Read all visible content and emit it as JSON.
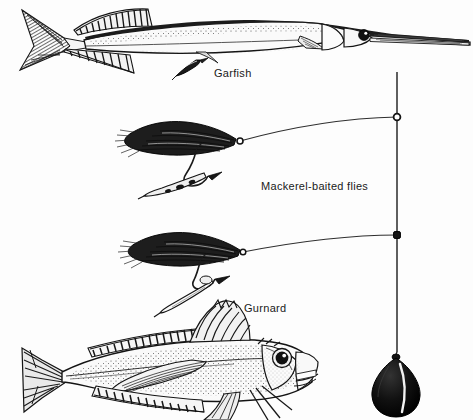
{
  "figure": {
    "kind": "line-illustration",
    "background_color": "#fdfdfd",
    "ink_color": "#1a1a1a",
    "width": 473,
    "height": 420
  },
  "labels": {
    "garfish": "Garfish",
    "mackerel_flies": "Mackerel-baited flies",
    "gurnard": "Gurnard"
  },
  "rig": {
    "mainline": {
      "name": "vertical-mainline",
      "x": 397,
      "y_top": 72,
      "y_bottom": 352,
      "color": "#2a2a2a"
    },
    "swivels": [
      {
        "name": "upper-swivel-ring",
        "x": 397,
        "y": 117
      },
      {
        "name": "lower-swivel-ring",
        "x": 397,
        "y": 235
      }
    ],
    "droppers": [
      {
        "name": "upper-dropper",
        "from_x": 397,
        "from_y": 117,
        "to_x": 240,
        "to_y": 141
      },
      {
        "name": "lower-dropper",
        "from_x": 397,
        "from_y": 235,
        "to_x": 243,
        "to_y": 252
      }
    ],
    "sinker": {
      "name": "lead-weight",
      "shape": "teardrop",
      "center_x": 397,
      "center_y": 383,
      "fill": "#0d0d0d"
    }
  },
  "specimens": [
    {
      "name": "garfish",
      "label": "Garfish",
      "position": "top",
      "features": [
        "elongated body",
        "needle beak",
        "forked tail",
        "dorsal fin",
        "anal fin"
      ]
    },
    {
      "name": "gurnard",
      "label": "Gurnard",
      "position": "bottom",
      "features": [
        "spiny dorsal fin",
        "large pectoral fins",
        "finger rays",
        "large eye",
        "blunt head"
      ]
    }
  ],
  "lures": [
    {
      "name": "upper-fly",
      "label": "Mackerel-baited fly",
      "parts": [
        "feather wing",
        "hook",
        "mackerel strip bait"
      ]
    },
    {
      "name": "lower-fly",
      "label": "Mackerel-baited fly",
      "parts": [
        "feather wing",
        "hook",
        "mackerel strip bait"
      ]
    },
    {
      "name": "garfish-bait-strip",
      "label": "bait strip",
      "parts": [
        "mackerel strip bait"
      ]
    }
  ]
}
